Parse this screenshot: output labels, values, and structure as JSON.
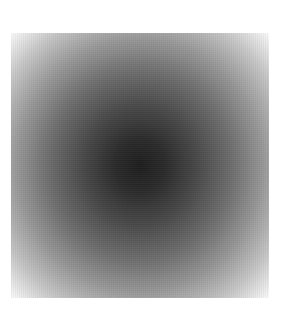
{
  "image": {
    "description": "Square radial gradient: dark center fading to white corners",
    "colors": {
      "center": "#1c1c1c",
      "mid": "#6e6e6e",
      "edge": "#ffffff",
      "background": "#ffffff"
    }
  }
}
